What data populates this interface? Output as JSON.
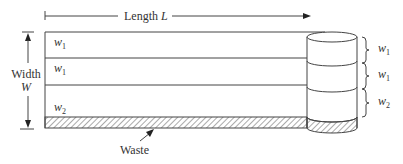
{
  "diagram": {
    "length_label": "Length ",
    "length_symbol": "L",
    "width_label": "Width",
    "width_symbol": "W",
    "strip_labels": [
      {
        "base": "w",
        "sub": "1"
      },
      {
        "base": "w",
        "sub": "1"
      },
      {
        "base": "w",
        "sub": "2"
      }
    ],
    "roll_labels": [
      {
        "base": "w",
        "sub": "1"
      },
      {
        "base": "w",
        "sub": "1"
      },
      {
        "base": "w",
        "sub": "2"
      }
    ],
    "waste_label": "Waste",
    "colors": {
      "line": "#444444",
      "text": "#333333",
      "hatch": "#555555"
    }
  }
}
